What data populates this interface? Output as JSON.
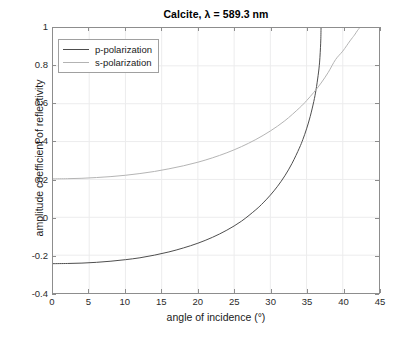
{
  "chart_data": {
    "type": "line",
    "title": "Calcite, λ = 589.3 nm",
    "xlabel": "angle of incidence (°)",
    "ylabel": "amplitude coefficient of reflectivity",
    "xlim": [
      0,
      45
    ],
    "ylim": [
      -0.4,
      1
    ],
    "xticks": [
      0,
      5,
      10,
      15,
      20,
      25,
      30,
      35,
      40,
      45
    ],
    "xtick_labels": [
      "0",
      "5",
      "10",
      "15",
      "20",
      "25",
      "30",
      "35",
      "40",
      "45"
    ],
    "yticks": [
      -0.4,
      -0.2,
      0,
      0.2,
      0.4,
      0.6,
      0.8,
      1
    ],
    "ytick_labels": [
      "-0.4",
      "-0.2",
      "0",
      "0.2",
      "0.4",
      "0.6",
      "0.8",
      "1"
    ],
    "grid": true,
    "legend_position": "top-left",
    "series": [
      {
        "name": "p-polarization",
        "color": "#4d4d4d",
        "x": [
          0,
          2,
          4,
          6,
          8,
          10,
          12,
          14,
          16,
          18,
          20,
          22,
          24,
          26,
          28,
          29,
          30,
          31,
          32,
          33,
          34,
          34.5,
          35,
          35.5,
          36,
          36.3,
          36.6,
          36.8,
          36.95,
          37.0
        ],
        "y": [
          -0.245,
          -0.244,
          -0.242,
          -0.238,
          -0.232,
          -0.224,
          -0.214,
          -0.2,
          -0.183,
          -0.162,
          -0.137,
          -0.106,
          -0.068,
          -0.021,
          0.04,
          0.076,
          0.117,
          0.164,
          0.219,
          0.285,
          0.365,
          0.412,
          0.467,
          0.532,
          0.612,
          0.672,
          0.75,
          0.82,
          0.92,
          1.0
        ]
      },
      {
        "name": "s-polarization",
        "color": "#b3b3b3",
        "x": [
          0,
          2,
          4,
          6,
          8,
          10,
          12,
          14,
          16,
          18,
          20,
          22,
          24,
          26,
          28,
          30,
          32,
          34,
          35,
          36,
          37,
          38,
          39,
          40,
          41,
          41.6,
          42.0,
          42.2,
          42.3
        ],
        "y": [
          0.203,
          0.204,
          0.206,
          0.21,
          0.215,
          0.222,
          0.231,
          0.242,
          0.256,
          0.272,
          0.291,
          0.314,
          0.341,
          0.373,
          0.411,
          0.456,
          0.51,
          0.577,
          0.616,
          0.66,
          0.709,
          0.766,
          0.833,
          0.878,
          0.932,
          0.962,
          0.985,
          0.995,
          1.0
        ]
      }
    ]
  },
  "legend": {
    "items": [
      {
        "label": "p-polarization"
      },
      {
        "label": "s-polarization"
      }
    ]
  }
}
